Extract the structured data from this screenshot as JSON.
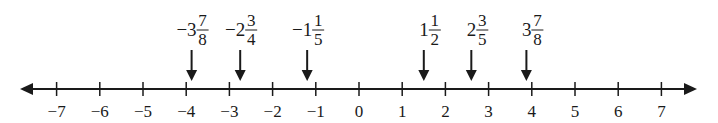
{
  "diagram": {
    "type": "number-line",
    "range": [
      -7,
      7
    ],
    "tick_values": [
      -7,
      -6,
      -5,
      -4,
      -3,
      -2,
      -1,
      0,
      1,
      2,
      3,
      4,
      5,
      6,
      7
    ],
    "tick_labels": [
      "−7",
      "−6",
      "−5",
      "−4",
      "−3",
      "−2",
      "−1",
      "0",
      "1",
      "2",
      "3",
      "4",
      "5",
      "6",
      "7"
    ],
    "line_color": "#1a1a1a",
    "both_ends_arrows": true,
    "markers": [
      {
        "value": -3.875,
        "sign": "−",
        "whole": "3",
        "numerator": "7",
        "denominator": "8"
      },
      {
        "value": -2.75,
        "sign": "−",
        "whole": "2",
        "numerator": "3",
        "denominator": "4"
      },
      {
        "value": -1.2,
        "sign": "−",
        "whole": "1",
        "numerator": "1",
        "denominator": "5"
      },
      {
        "value": 1.5,
        "sign": "",
        "whole": "1",
        "numerator": "1",
        "denominator": "2"
      },
      {
        "value": 2.6,
        "sign": "",
        "whole": "2",
        "numerator": "3",
        "denominator": "5"
      },
      {
        "value": 3.875,
        "sign": "",
        "whole": "3",
        "numerator": "7",
        "denominator": "8"
      }
    ]
  }
}
